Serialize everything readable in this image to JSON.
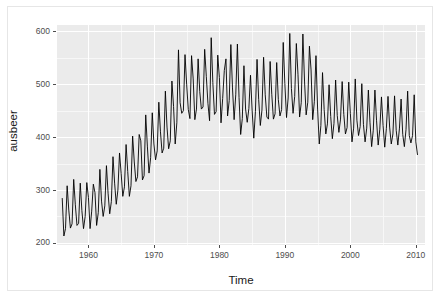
{
  "figure": {
    "background_color": "#ffffff",
    "panel_background_color": "#ebebeb",
    "gridline_color": "#ffffff",
    "line_color": "#000000",
    "frame_border_color": "#e6e6e6"
  },
  "axes": {
    "x": {
      "title": "Time",
      "tick_labels": [
        "1960",
        "1970",
        "1980",
        "1990",
        "2000",
        "2010"
      ],
      "tick_values": [
        1960,
        1970,
        1980,
        1990,
        2000,
        2010
      ],
      "range": [
        1955.2,
        2011.4
      ]
    },
    "y": {
      "title": "ausbeer",
      "tick_labels": [
        "200",
        "300",
        "400",
        "500",
        "600"
      ],
      "tick_values": [
        200,
        300,
        400,
        500,
        600
      ],
      "range": [
        196,
        612
      ]
    }
  },
  "chart_data": {
    "type": "line",
    "title": "",
    "subtitle": "",
    "xlabel": "Time",
    "ylabel": "ausbeer",
    "xlim": [
      1955.2,
      2011.4
    ],
    "ylim": [
      196,
      612
    ],
    "grid": true,
    "legend": null,
    "x_tick_labels": [
      "1960",
      "1970",
      "1980",
      "1990",
      "2000",
      "2010"
    ],
    "y_tick_labels": [
      "200",
      "300",
      "400",
      "500",
      "600"
    ],
    "series": [
      {
        "name": "ausbeer",
        "x_start": 1956.0,
        "x_step": 0.25,
        "frequency": "quarterly",
        "values": [
          284,
          213,
          227,
          308,
          262,
          228,
          236,
          320,
          272,
          233,
          237,
          313,
          261,
          227,
          250,
          314,
          286,
          227,
          260,
          311,
          295,
          233,
          257,
          339,
          279,
          250,
          270,
          346,
          294,
          255,
          278,
          363,
          313,
          273,
          300,
          370,
          331,
          288,
          306,
          386,
          335,
          288,
          308,
          402,
          353,
          316,
          325,
          405,
          393,
          319,
          327,
          442,
          383,
          332,
          361,
          446,
          387,
          357,
          374,
          466,
          410,
          370,
          379,
          487,
          419,
          378,
          393,
          506,
          458,
          387,
          427,
          565,
          465,
          445,
          450,
          556,
          500,
          452,
          435,
          554,
          510,
          433,
          453,
          548,
          486,
          453,
          457,
          566,
          515,
          464,
          431,
          588,
          503,
          443,
          448,
          555,
          513,
          427,
          473,
          526,
          548,
          440,
          469,
          575,
          493,
          433,
          480,
          576,
          475,
          405,
          435,
          535,
          453,
          428,
          454,
          517,
          451,
          398,
          448,
          547,
          471,
          422,
          451,
          551,
          480,
          438,
          434,
          543,
          481,
          434,
          444,
          541,
          471,
          440,
          452,
          579,
          501,
          437,
          474,
          596,
          492,
          445,
          477,
          577,
          519,
          438,
          465,
          595,
          506,
          442,
          466,
          572,
          527,
          433,
          467,
          554,
          453,
          387,
          422,
          522,
          452,
          406,
          425,
          499,
          439,
          397,
          426,
          508,
          441,
          409,
          434,
          505,
          443,
          406,
          418,
          504,
          445,
          391,
          417,
          510,
          432,
          403,
          420,
          501,
          424,
          391,
          417,
          489,
          427,
          382,
          413,
          489,
          432,
          385,
          415,
          476,
          422,
          381,
          416,
          477,
          419,
          387,
          406,
          478,
          413,
          385,
          417,
          472,
          405,
          382,
          414,
          487,
          403,
          389,
          403,
          480,
          391,
          367
        ],
        "n_points": 218,
        "value_min": 213,
        "value_max": 596,
        "first_value": 284,
        "last_value": 367
      }
    ]
  }
}
